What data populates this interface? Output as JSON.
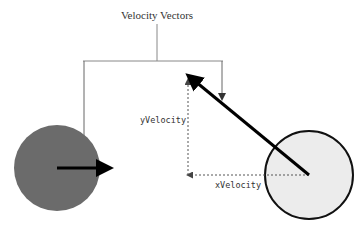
{
  "diagram": {
    "title": "Velocity Vectors",
    "labels": {
      "y_component": "yVelocity",
      "x_component": "xVelocity"
    },
    "colors": {
      "background": "#ffffff",
      "dark_ball_fill": "#6b6b6b",
      "light_ball_fill": "#ececec",
      "light_ball_stroke": "#111111",
      "vector_stroke": "#000000",
      "leader_line": "#888888",
      "dashed_component": "#555555"
    },
    "objects": [
      {
        "name": "slow-ball",
        "shape": "circle",
        "fill": "dark",
        "velocity_arrow": "short-horizontal-right"
      },
      {
        "name": "fast-ball",
        "shape": "circle",
        "fill": "light",
        "velocity_arrow": "long-diagonal-up-left"
      }
    ]
  }
}
